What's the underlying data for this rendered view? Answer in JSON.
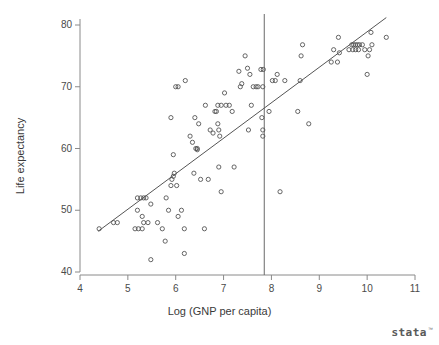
{
  "chart_data": {
    "type": "scatter",
    "title": "",
    "xlabel": "Log (GNP per capita)",
    "ylabel": "Life expectancy",
    "xlim": [
      3.7,
      11.3
    ],
    "ylim": [
      38.0,
      82.0
    ],
    "xticks": [
      4,
      5,
      6,
      7,
      8,
      9,
      10,
      11
    ],
    "yticks": [
      40,
      50,
      60,
      70,
      80
    ],
    "xtick_labels": [
      "4",
      "5",
      "6",
      "7",
      "8",
      "9",
      "10",
      "11"
    ],
    "ytick_labels": [
      "40",
      "50",
      "60",
      "70",
      "80"
    ],
    "grid": false,
    "legend": "none",
    "marker": "open-circle",
    "marker_color": "#555555",
    "line_color": "#555555",
    "annotations": [
      {
        "name": "vertical-reference-line",
        "type": "vline",
        "x": 7.85,
        "color": "#6a6a6a"
      },
      {
        "name": "regression-fit-line",
        "type": "line",
        "x0": 4.38,
        "y0": 46.6,
        "x1": 10.4,
        "y1": 81.2,
        "color": "#555555"
      }
    ],
    "points": [
      [
        4.4,
        47.0
      ],
      [
        4.7,
        48.0
      ],
      [
        4.78,
        48.0
      ],
      [
        5.2,
        52.0
      ],
      [
        5.27,
        52.0
      ],
      [
        5.33,
        52.0
      ],
      [
        5.38,
        52.0
      ],
      [
        5.2,
        50.0
      ],
      [
        5.15,
        47.0
      ],
      [
        5.22,
        47.0
      ],
      [
        5.3,
        47.0
      ],
      [
        5.3,
        49.0
      ],
      [
        5.33,
        48.0
      ],
      [
        5.42,
        48.0
      ],
      [
        5.48,
        51.0
      ],
      [
        5.48,
        42.0
      ],
      [
        5.62,
        48.0
      ],
      [
        5.72,
        47.0
      ],
      [
        5.78,
        45.0
      ],
      [
        5.8,
        52.0
      ],
      [
        5.85,
        50.0
      ],
      [
        5.9,
        54.0
      ],
      [
        5.92,
        55.0
      ],
      [
        5.95,
        55.5
      ],
      [
        5.97,
        56.0
      ],
      [
        5.95,
        59.0
      ],
      [
        5.9,
        65.0
      ],
      [
        6.0,
        70.0
      ],
      [
        6.05,
        70.0
      ],
      [
        6.02,
        54.0
      ],
      [
        6.05,
        49.0
      ],
      [
        6.12,
        50.0
      ],
      [
        6.18,
        47.0
      ],
      [
        6.18,
        43.0
      ],
      [
        6.2,
        71.0
      ],
      [
        6.3,
        62.0
      ],
      [
        6.35,
        61.0
      ],
      [
        6.38,
        56.0
      ],
      [
        6.42,
        60.0
      ],
      [
        6.45,
        60.0
      ],
      [
        6.45,
        59.8
      ],
      [
        6.4,
        65.0
      ],
      [
        6.48,
        64.0
      ],
      [
        6.52,
        55.0
      ],
      [
        6.6,
        47.0
      ],
      [
        6.62,
        67.0
      ],
      [
        6.68,
        55.0
      ],
      [
        6.72,
        63.0
      ],
      [
        6.78,
        62.5
      ],
      [
        6.82,
        66.0
      ],
      [
        6.85,
        66.0
      ],
      [
        6.88,
        64.0
      ],
      [
        6.9,
        63.0
      ],
      [
        6.88,
        67.0
      ],
      [
        6.95,
        67.0
      ],
      [
        6.92,
        62.0
      ],
      [
        6.9,
        57.0
      ],
      [
        6.95,
        53.0
      ],
      [
        7.02,
        69.0
      ],
      [
        7.05,
        67.0
      ],
      [
        7.12,
        67.0
      ],
      [
        7.18,
        66.0
      ],
      [
        7.22,
        57.0
      ],
      [
        7.32,
        72.5
      ],
      [
        7.35,
        70.0
      ],
      [
        7.38,
        70.5
      ],
      [
        7.45,
        75.0
      ],
      [
        7.5,
        73.0
      ],
      [
        7.55,
        72.0
      ],
      [
        7.58,
        67.0
      ],
      [
        7.52,
        63.0
      ],
      [
        7.62,
        70.0
      ],
      [
        7.68,
        70.0
      ],
      [
        7.72,
        70.0
      ],
      [
        7.78,
        72.8
      ],
      [
        7.83,
        72.8
      ],
      [
        7.82,
        70.0
      ],
      [
        7.8,
        65.0
      ],
      [
        7.82,
        63.0
      ],
      [
        7.82,
        62.0
      ],
      [
        7.95,
        66.0
      ],
      [
        8.02,
        71.0
      ],
      [
        8.08,
        71.0
      ],
      [
        8.12,
        72.0
      ],
      [
        8.18,
        53.0
      ],
      [
        8.28,
        71.0
      ],
      [
        8.55,
        66.0
      ],
      [
        8.6,
        71.0
      ],
      [
        8.62,
        75.0
      ],
      [
        8.65,
        76.8
      ],
      [
        8.78,
        64.0
      ],
      [
        9.25,
        74.0
      ],
      [
        9.3,
        76.0
      ],
      [
        9.38,
        74.0
      ],
      [
        9.4,
        78.0
      ],
      [
        9.42,
        75.5
      ],
      [
        9.62,
        76.0
      ],
      [
        9.68,
        76.8
      ],
      [
        9.72,
        76.8
      ],
      [
        9.76,
        76.8
      ],
      [
        9.8,
        76.8
      ],
      [
        9.84,
        76.8
      ],
      [
        9.7,
        76.0
      ],
      [
        9.76,
        76.0
      ],
      [
        9.82,
        76.0
      ],
      [
        9.9,
        76.8
      ],
      [
        9.95,
        76.0
      ],
      [
        10.0,
        72.0
      ],
      [
        10.02,
        75.0
      ],
      [
        10.05,
        76.0
      ],
      [
        10.08,
        78.8
      ],
      [
        10.1,
        76.8
      ],
      [
        10.4,
        78.0
      ]
    ]
  },
  "branding": {
    "logo_text": "stata",
    "trademark": "™"
  }
}
